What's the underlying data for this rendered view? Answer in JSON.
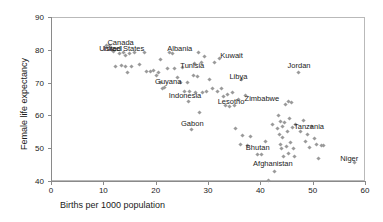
{
  "chart_data": {
    "type": "scatter",
    "title": "",
    "xlabel": "Births per 1000 population",
    "ylabel": "Female life expectancy",
    "xlim": [
      0,
      60
    ],
    "ylim": [
      40,
      90
    ],
    "xticks": [
      0,
      10,
      20,
      30,
      40,
      50,
      60
    ],
    "yticks": [
      40,
      50,
      60,
      70,
      80,
      90
    ],
    "grid": false,
    "legend": null,
    "marker": "small-grey-diamond",
    "points": [
      [
        10.7,
        81.3
      ],
      [
        11.2,
        81.2
      ],
      [
        11.5,
        80.1
      ],
      [
        12.0,
        79.5
      ],
      [
        12.4,
        75.0
      ],
      [
        13.0,
        78.9
      ],
      [
        13.4,
        75.1
      ],
      [
        13.8,
        79.3
      ],
      [
        14.2,
        75.0
      ],
      [
        14.3,
        78.4
      ],
      [
        14.7,
        73.2
      ],
      [
        15.0,
        79.0
      ],
      [
        15.4,
        74.9
      ],
      [
        16.0,
        79.1
      ],
      [
        17.0,
        75.6
      ],
      [
        17.8,
        79.1
      ],
      [
        18.2,
        73.4
      ],
      [
        19.0,
        73.5
      ],
      [
        19.6,
        73.8
      ],
      [
        20.2,
        72.3
      ],
      [
        20.6,
        73.2
      ],
      [
        20.9,
        69.9
      ],
      [
        21.0,
        77.0
      ],
      [
        21.3,
        68.3
      ],
      [
        21.6,
        68.6
      ],
      [
        22.3,
        74.2
      ],
      [
        22.7,
        79.2
      ],
      [
        23.2,
        79.0
      ],
      [
        23.6,
        74.3
      ],
      [
        24.2,
        71.5
      ],
      [
        24.7,
        69.9
      ],
      [
        25.2,
        74.5
      ],
      [
        25.6,
        67.4
      ],
      [
        26.0,
        70.1
      ],
      [
        26.2,
        64.2
      ],
      [
        26.5,
        67.4
      ],
      [
        26.8,
        55.8
      ],
      [
        27.2,
        72.3
      ],
      [
        27.4,
        75.9
      ],
      [
        27.6,
        67.0
      ],
      [
        27.9,
        71.9
      ],
      [
        28.2,
        79.2
      ],
      [
        28.4,
        60.9
      ],
      [
        28.7,
        76.0
      ],
      [
        29.0,
        67.1
      ],
      [
        29.4,
        78.1
      ],
      [
        29.8,
        67.3
      ],
      [
        30.3,
        71.0
      ],
      [
        30.8,
        68.2
      ],
      [
        31.2,
        76.1
      ],
      [
        31.8,
        67.2
      ],
      [
        32.2,
        77.5
      ],
      [
        32.6,
        68.2
      ],
      [
        33.0,
        65.8
      ],
      [
        33.4,
        63.0
      ],
      [
        33.8,
        66.3
      ],
      [
        34.2,
        62.8
      ],
      [
        34.6,
        67.1
      ],
      [
        35.0,
        63.1
      ],
      [
        35.3,
        55.9
      ],
      [
        35.8,
        64.9
      ],
      [
        36.2,
        51.0
      ],
      [
        36.4,
        70.8
      ],
      [
        36.6,
        54.0
      ],
      [
        37.2,
        66.1
      ],
      [
        37.6,
        50.8
      ],
      [
        38.2,
        53.5
      ],
      [
        39.4,
        48.2
      ],
      [
        40.2,
        48.1
      ],
      [
        41.0,
        52.0
      ],
      [
        41.6,
        40.3
      ],
      [
        42.4,
        57.2
      ],
      [
        42.8,
        43.0
      ],
      [
        43.2,
        56.0
      ],
      [
        43.4,
        59.9
      ],
      [
        43.6,
        54.3
      ],
      [
        43.8,
        51.0
      ],
      [
        43.9,
        58.2
      ],
      [
        44.0,
        49.8
      ],
      [
        44.2,
        56.5
      ],
      [
        44.3,
        53.2
      ],
      [
        44.5,
        47.5
      ],
      [
        44.6,
        57.8
      ],
      [
        44.8,
        63.2
      ],
      [
        45.0,
        50.5
      ],
      [
        45.2,
        55.0
      ],
      [
        45.3,
        64.1
      ],
      [
        45.4,
        48.5
      ],
      [
        45.6,
        59.0
      ],
      [
        45.8,
        51.8
      ],
      [
        46.0,
        63.9
      ],
      [
        46.2,
        56.2
      ],
      [
        46.4,
        49.9
      ],
      [
        46.6,
        47.4
      ],
      [
        46.8,
        57.3
      ],
      [
        47.2,
        73.0
      ],
      [
        47.6,
        55.1
      ],
      [
        48.2,
        58.4
      ],
      [
        48.6,
        52.0
      ],
      [
        49.0,
        54.2
      ],
      [
        49.4,
        50.1
      ],
      [
        49.8,
        56.6
      ],
      [
        50.4,
        53.0
      ],
      [
        50.8,
        51.2
      ],
      [
        51.2,
        47.0
      ],
      [
        51.6,
        50.9
      ],
      [
        52.0,
        50.8
      ],
      [
        58.0,
        45.5
      ]
    ],
    "annotations": [
      {
        "label": "Canada",
        "x": 13.3,
        "y": 82.2
      },
      {
        "label": "United States",
        "x": 13.5,
        "y": 80.1
      },
      {
        "label": "Israel",
        "x": 11.8,
        "y": 80.1
      },
      {
        "label": "Albania",
        "x": 24.6,
        "y": 80.2
      },
      {
        "label": "Kuwait",
        "x": 34.5,
        "y": 78.1
      },
      {
        "label": "Tunisia",
        "x": 27.0,
        "y": 75.2
      },
      {
        "label": "Jordan",
        "x": 47.4,
        "y": 75.0
      },
      {
        "label": "Libya",
        "x": 35.8,
        "y": 71.7
      },
      {
        "label": "Guyana",
        "x": 22.4,
        "y": 70.1
      },
      {
        "label": "Indonesia",
        "x": 25.6,
        "y": 66.0
      },
      {
        "label": "Lesotho",
        "x": 34.4,
        "y": 64.2
      },
      {
        "label": "Zimbabwe",
        "x": 40.3,
        "y": 65.1
      },
      {
        "label": "Gabon",
        "x": 27.0,
        "y": 57.5
      },
      {
        "label": "Tanzania",
        "x": 49.3,
        "y": 56.6
      },
      {
        "label": "Bhutan",
        "x": 39.5,
        "y": 50.2
      },
      {
        "label": "Afghanistan",
        "x": 42.4,
        "y": 45.2
      },
      {
        "label": "Niger",
        "x": 57.0,
        "y": 46.6
      }
    ]
  }
}
